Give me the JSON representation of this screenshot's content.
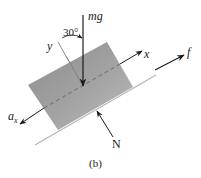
{
  "diagram": {
    "type": "free-body-diagram",
    "caption": "(b)",
    "block": {
      "fill_color": "#9a9a9a",
      "corners": [
        [
          28,
          85
        ],
        [
          107,
          42
        ],
        [
          133,
          87
        ],
        [
          58,
          130
        ]
      ]
    },
    "incline": {
      "color": "#b5b5b5"
    },
    "angle": {
      "label": "30°",
      "value_deg": 30
    },
    "forces": [
      {
        "name": "weight",
        "label": "mg",
        "direction": "down"
      },
      {
        "name": "friction",
        "label": "f",
        "direction": "up-the-incline"
      },
      {
        "name": "normal",
        "label": "N",
        "direction": "perpendicular-into-block"
      }
    ],
    "axes": [
      {
        "name": "x",
        "label": "x"
      },
      {
        "name": "y",
        "label": "y"
      }
    ],
    "acceleration": {
      "label": "a",
      "subscript": "x",
      "direction": "down-the-incline"
    }
  }
}
